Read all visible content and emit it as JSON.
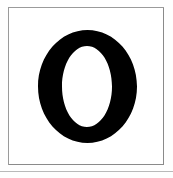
{
  "image": {
    "kind": "scanned-letterform-specimen",
    "width_px": 173,
    "height_px": 178,
    "background_color": "#ffffff"
  },
  "frame": {
    "name": "thin-rule-box",
    "stroke_color": "#8a8a8a",
    "stroke_width_px": 1,
    "fill_color": "#ffffff",
    "left_px": 8,
    "top_px": 7,
    "width_px": 156,
    "height_px": 158
  },
  "glyph": {
    "character": "O",
    "label": "Capital letter O",
    "style": "bold serif, high stroke contrast",
    "fill_color": "#000000",
    "outer_left_px": 38,
    "outer_top_px": 30,
    "outer_width_px": 99,
    "outer_height_px": 113,
    "counter_left_px": 62,
    "counter_top_px": 46,
    "counter_width_px": 50,
    "counter_height_px": 81,
    "side_stroke_px": 24,
    "cap_stroke_px": 16
  },
  "artifacts": {
    "bottom_edge_color": "#b9b9b9",
    "paper_tone": "#fefefe"
  }
}
